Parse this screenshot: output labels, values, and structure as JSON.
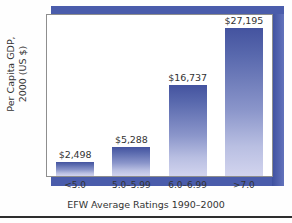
{
  "chart_data": {
    "type": "bar",
    "title": "",
    "categories": [
      "<5.0",
      "5.0–5.99",
      "6.0–6.99",
      ">7.0"
    ],
    "values": [
      2498,
      5288,
      16737,
      27195
    ],
    "value_labels": [
      "$2,498",
      "$5,288",
      "$16,737",
      "$27,195"
    ],
    "xlabel": "EFW Average Ratings 1990–2000",
    "ylabel": "Per Capita GDP, 2000 (US $)",
    "ylabel_line1": "Per Capita GDP,",
    "ylabel_line2": "2000 (US $)",
    "ylim": [
      0,
      29500
    ],
    "grid": false,
    "legend": false,
    "axis_ticks_visible": false,
    "colors": {
      "bar_top": "#44539f",
      "bar_bottom": "#d2d4ee",
      "frame": "#4a5cab",
      "panel_background": "#ffffff",
      "panel_border": "#8e8e8e",
      "text": "#333333",
      "rule": "#2e2e2e",
      "page_background": "#fefefe"
    }
  }
}
